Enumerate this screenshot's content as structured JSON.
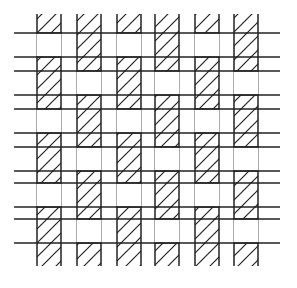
{
  "diagram": {
    "type": "plain-weave",
    "warp_count": 6,
    "weft_count": 6,
    "warp_fill": "hatched",
    "weft_fill": "plain",
    "stroke_color": "#222222",
    "background_color": "#ffffff",
    "interlacing": "alternating-over-under",
    "first_weft_over_warps": [
      1,
      3,
      5
    ]
  }
}
